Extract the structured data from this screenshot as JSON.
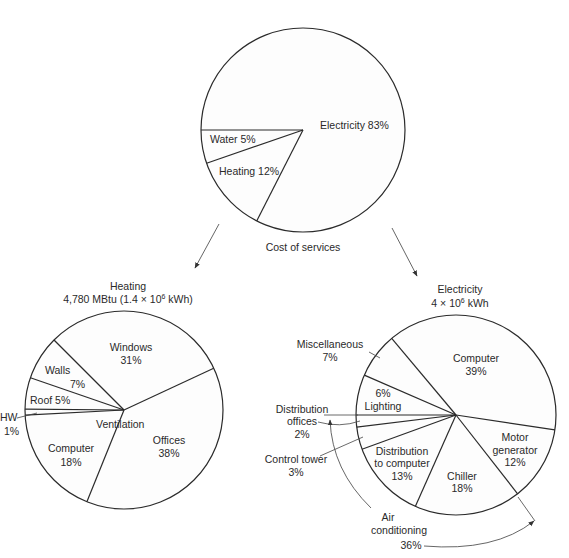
{
  "chart_data": [
    {
      "type": "pie",
      "title": "Cost of services",
      "center": [
        303,
        130
      ],
      "radius": 102,
      "boundary_angles_deg": [
        180,
        161,
        117
      ],
      "slices": [
        {
          "label": "Electricity",
          "value": 83,
          "text": "Electricity 83%"
        },
        {
          "label": "Heating",
          "value": 12,
          "text": "Heating 12%"
        },
        {
          "label": "Water",
          "value": 5,
          "text": "Water 5%"
        }
      ]
    },
    {
      "type": "pie",
      "title": "Heating",
      "subtitle": "4,780 MBtu (1.4 × 10⁶ kWh)",
      "center": [
        124,
        410
      ],
      "radius": 99,
      "boundary_angles_deg": [
        225,
        199,
        180.5,
        177,
        112,
        335
      ],
      "slices": [
        {
          "label": "Windows",
          "value": 31
        },
        {
          "label": "Offices",
          "value": 38,
          "note": "Ventilation"
        },
        {
          "label": "Computer",
          "value": 18,
          "note": "Ventilation"
        },
        {
          "label": "HW",
          "value": 1
        },
        {
          "label": "Roof",
          "value": 5
        },
        {
          "label": "Walls",
          "value": 7
        }
      ],
      "group_label": "Ventilation"
    },
    {
      "type": "pie",
      "title": "Electricity",
      "subtitle": "4 × 10⁶ kWh",
      "center": [
        456,
        415
      ],
      "radius": 100,
      "boundary_angles_deg": [
        230,
        8.5,
        52,
        114,
        160,
        173,
        180,
        203.5
      ],
      "slices": [
        {
          "label": "Computer",
          "value": 39
        },
        {
          "label": "Motor generator",
          "value": 12
        },
        {
          "label": "Chiller",
          "value": 18
        },
        {
          "label": "Distribution to computer",
          "value": 13
        },
        {
          "label": "Control tower",
          "value": 3
        },
        {
          "label": "Distribution offices",
          "value": 2
        },
        {
          "label": "Lighting",
          "value": 6
        },
        {
          "label": "Miscellaneous",
          "value": 7
        }
      ],
      "group": {
        "label": "Air conditioning",
        "value": 36
      }
    }
  ],
  "labels": {
    "top": {
      "electricity": "Electricity 83%",
      "water": "Water 5%",
      "heating": "Heating 12%",
      "caption": "Cost of services"
    },
    "heating": {
      "title": "Heating",
      "subtitle": "4,780 MBtu (1.4 × 10",
      "subtitle_exp": "6",
      "subtitle_tail": " kWh)",
      "windows": "Windows",
      "windows_pct": "31%",
      "walls": "Walls",
      "walls_pct": "7%",
      "roof": "Roof 5%",
      "hw": "HW",
      "hw_pct": "1%",
      "ventilation": "Ventilation",
      "offices": "Offices",
      "offices_pct": "38%",
      "computer": "Computer",
      "computer_pct": "18%"
    },
    "electricity": {
      "title": "Electricity",
      "subtitle": "4 × 10",
      "subtitle_exp": "6",
      "subtitle_tail": " kWh",
      "misc": "Miscellaneous",
      "misc_pct": "7%",
      "computer": "Computer",
      "computer_pct": "39%",
      "lighting_pct": "6%",
      "lighting": "Lighting",
      "dist_offices_1": "Distribution",
      "dist_offices_2": "offices",
      "dist_offices_pct": "2%",
      "control_tower": "Control tower",
      "control_tower_pct": "3%",
      "dist_computer_1": "Distribution",
      "dist_computer_2": "to computer",
      "dist_computer_pct": "13%",
      "chiller": "Chiller",
      "chiller_pct": "18%",
      "motor_1": "Motor",
      "motor_2": "generator",
      "motor_pct": "12%",
      "ac_1": "Air",
      "ac_2": "conditioning",
      "ac_pct": "36%"
    }
  }
}
